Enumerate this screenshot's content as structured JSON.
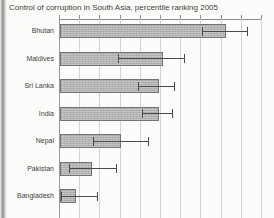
{
  "title": "Control of corruption in South Asia, percentile ranking 2005",
  "chart_data": {
    "type": "bar",
    "orientation": "horizontal",
    "title": "Control of corruption in South Asia, percentile ranking 2005",
    "categories": [
      "Bhutan",
      "Maldives",
      "Sri Lanka",
      "India",
      "Nepal",
      "Pakistan",
      "Bangladesh"
    ],
    "values": [
      82,
      51,
      49,
      49,
      30,
      16,
      8
    ],
    "error_low": [
      71,
      29,
      39,
      41,
      17,
      5,
      1
    ],
    "error_high": [
      93,
      62,
      57,
      56,
      44,
      28,
      19
    ],
    "xlabel": "",
    "ylabel": "",
    "xlim": [
      0,
      100
    ],
    "grid": true,
    "gridline_interval": 10,
    "legend": "none",
    "colors": {
      "bar_fill": "#b6b6b6",
      "bar_border": "#737373",
      "gridline": "#d3d3d8",
      "axis": "#8c8c8c",
      "error_bar": "#4a4a4a",
      "title_text": "#3c3c3c",
      "label_text": "#3f3f3f",
      "background": "#fcfcfb"
    }
  }
}
